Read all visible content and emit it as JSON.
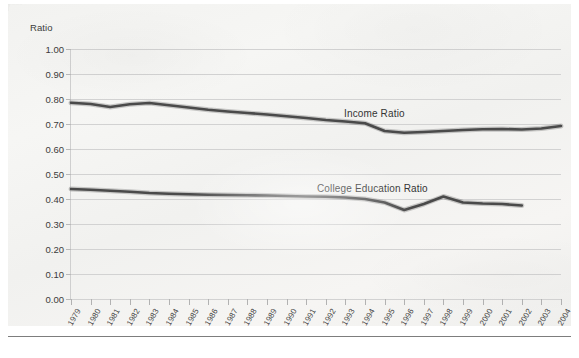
{
  "figure": {
    "background_color": "#f3f3f1",
    "grid_color": "#d2d2d2",
    "line_color": "#4a4a4a"
  },
  "chart_data": {
    "type": "line",
    "title": "",
    "subtitle": "",
    "xlabel": "",
    "ylabel": "Ratio",
    "ylim": [
      0.0,
      1.0
    ],
    "ytick_labels": [
      "0.00",
      "0.10",
      "0.20",
      "0.30",
      "0.40",
      "0.50",
      "0.60",
      "0.70",
      "0.80",
      "0.90",
      "1.00"
    ],
    "ytick_values": [
      0.0,
      0.1,
      0.2,
      0.3,
      0.4,
      0.5,
      0.6,
      0.7,
      0.8,
      0.9,
      1.0
    ],
    "grid": true,
    "legend_position": "inline-annotation",
    "categories": [
      "1979",
      "1980",
      "1981",
      "1982",
      "1983",
      "1984",
      "1985",
      "1986",
      "1987",
      "1988",
      "1989",
      "1990",
      "1991",
      "1992",
      "1993",
      "1994",
      "1995",
      "1996",
      "1997",
      "1998",
      "1999",
      "2000",
      "2001",
      "2002",
      "2003",
      "2004"
    ],
    "series": [
      {
        "name": "Income Ratio",
        "color": "#4a4a4a",
        "values": [
          0.785,
          0.78,
          0.768,
          0.779,
          0.784,
          0.775,
          0.766,
          0.757,
          0.75,
          0.744,
          0.738,
          0.731,
          0.724,
          0.716,
          0.71,
          0.703,
          0.672,
          0.665,
          0.668,
          0.672,
          0.676,
          0.679,
          0.68,
          0.678,
          0.682,
          0.692
        ],
        "annotation": {
          "text": "Income Ratio",
          "at_year": "1997"
        }
      },
      {
        "name": "College Education Ratio",
        "color": "#4a4a4a",
        "values": [
          0.44,
          0.437,
          0.433,
          0.429,
          0.424,
          0.421,
          0.419,
          0.417,
          0.416,
          0.415,
          0.414,
          0.412,
          0.41,
          0.409,
          0.406,
          0.4,
          0.386,
          0.356,
          0.38,
          0.41,
          0.386,
          0.382,
          0.38,
          0.374,
          null,
          null
        ],
        "annotation": {
          "text": "College Education Ratio",
          "at_year": "1996"
        }
      }
    ],
    "annotations": [
      {
        "text": "Income Ratio"
      },
      {
        "text": "College Education Ratio"
      }
    ]
  }
}
